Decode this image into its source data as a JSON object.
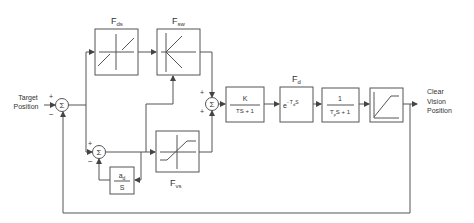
{
  "diagram": {
    "input_label_line1": "Target",
    "input_label_line2": "Position",
    "output_label_line1": "Clear",
    "output_label_line2": "Vision",
    "output_label_line3": "Position",
    "sum_symbol": "Σ",
    "plus": "+",
    "minus": "−",
    "blocks": {
      "fds": {
        "label": "F",
        "sub": "ds"
      },
      "fsw": {
        "label": "F",
        "sub": "sw"
      },
      "fvs": {
        "label": "F",
        "sub": "vs"
      },
      "fd": {
        "label": "F",
        "sub": "d"
      },
      "lag": {
        "num": "K",
        "den": "TS + 1"
      },
      "delay": {
        "base": "e",
        "exp_prefix": "- T",
        "exp_sub": "d",
        "exp_suffix": "S"
      },
      "plant": {
        "num": "1",
        "den_prefix": "T",
        "den_sub": "p",
        "den_suffix": "S + 1"
      },
      "integrator": {
        "num_base": "a",
        "num_sub": "d",
        "den": "S"
      }
    }
  }
}
